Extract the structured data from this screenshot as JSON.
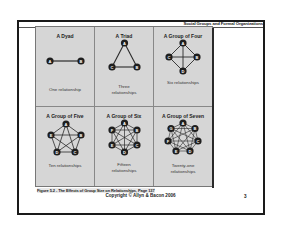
{
  "slide": {
    "header": "Social Groups and Formal Organizations",
    "figure_caption": "Figure 5.2 - The Effects of Group Size on Relationships, Page 137",
    "copyright": "Copyright © Allyn & Bacon 2006",
    "page_number": "3"
  },
  "figure": {
    "panels": [
      {
        "title": "A Dyad",
        "caption_line1": "One relationship",
        "caption_line2": "",
        "nodes": [
          "A",
          "B"
        ],
        "relationships": 1
      },
      {
        "title": "A Triad",
        "caption_line1": "Three",
        "caption_line2": "relationships",
        "nodes": [
          "A",
          "B",
          "C"
        ],
        "relationships": 3
      },
      {
        "title": "A Group of Four",
        "caption_line1": "Six relationships",
        "caption_line2": "",
        "nodes": [
          "A",
          "B",
          "C",
          "D"
        ],
        "relationships": 6
      },
      {
        "title": "A Group of Five",
        "caption_line1": "Ten relationships",
        "caption_line2": "",
        "nodes": [
          "A",
          "B",
          "C",
          "D",
          "E"
        ],
        "relationships": 10
      },
      {
        "title": "A Group of Six",
        "caption_line1": "Fifteen",
        "caption_line2": "relationships",
        "nodes": [
          "A",
          "B",
          "C",
          "D",
          "E",
          "F"
        ],
        "relationships": 15
      },
      {
        "title": "A Group of Seven",
        "caption_line1": "Twenty-one",
        "caption_line2": "relationships",
        "nodes": [
          "A",
          "B",
          "C",
          "D",
          "E",
          "F",
          "G"
        ],
        "relationships": 21
      }
    ]
  },
  "colors": {
    "panel_bg": "#d6d6d6",
    "node_fill": "#1e1e1e",
    "node_text": "#ffffff",
    "edge": "#2a2a2a",
    "frame": "#1a1a1a"
  }
}
